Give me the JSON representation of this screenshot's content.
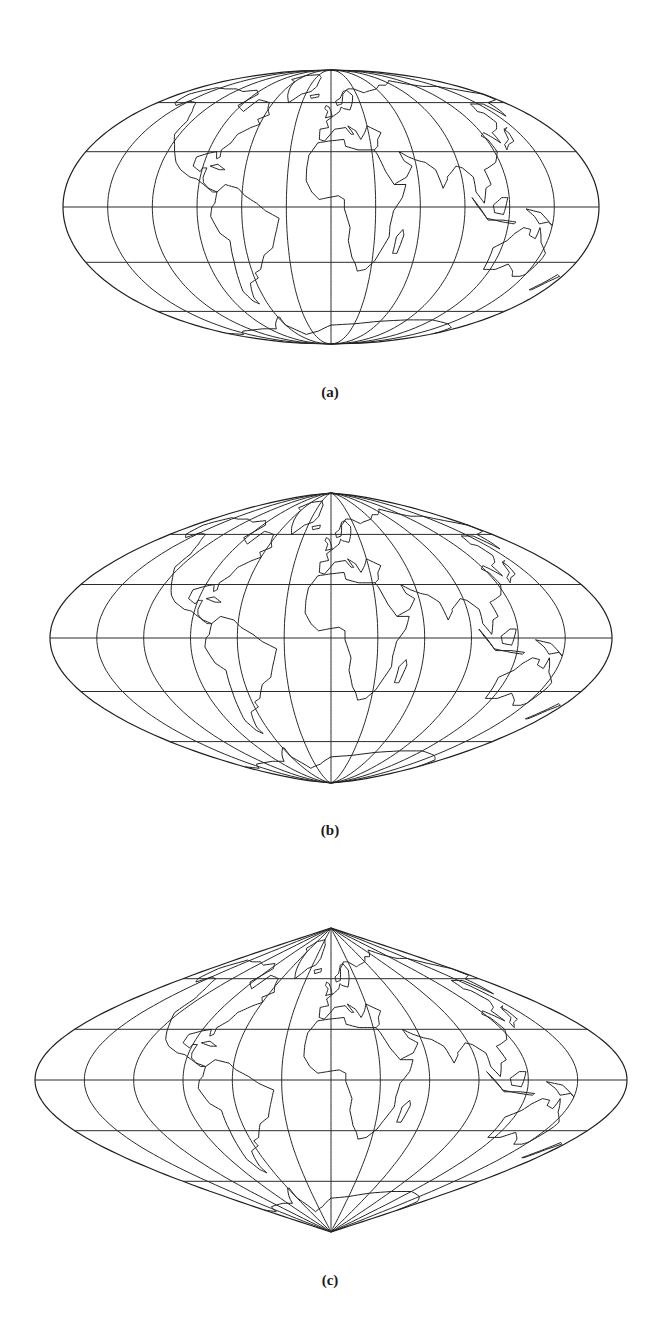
{
  "figure": {
    "panels": [
      {
        "id": "a",
        "caption": "(a)",
        "projection_style": "pseudocylindrical-elliptical",
        "shape": "ellipse",
        "cx": 331,
        "cy": 207,
        "half_width": 268,
        "half_height": 137,
        "caption_x": 330,
        "caption_y": 392,
        "pointed_poles": 0.0
      },
      {
        "id": "b",
        "caption": "(b)",
        "projection_style": "pseudocylindrical-intermediate",
        "shape": "blended",
        "cx": 331,
        "cy": 638,
        "half_width": 281,
        "half_height": 145,
        "caption_x": 330,
        "caption_y": 830,
        "pointed_poles": 0.5
      },
      {
        "id": "c",
        "caption": "(c)",
        "projection_style": "sinusoidal",
        "shape": "pointed",
        "cx": 331,
        "cy": 1080,
        "half_width": 296,
        "half_height": 152,
        "caption_x": 330,
        "caption_y": 1280,
        "pointed_poles": 1.0
      }
    ],
    "graticule": {
      "meridian_step_deg": 30,
      "parallels_deg": [
        -60,
        -30,
        0,
        30,
        60
      ],
      "line_color": "#2b2b2b"
    },
    "background_color": "#ffffff"
  }
}
